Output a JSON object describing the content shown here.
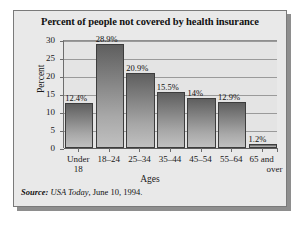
{
  "figure": {
    "title": "Percent of people not covered by health insurance",
    "source": {
      "lead": "Source:",
      "publication": " USA Today",
      "rest": ", June 10, 1994."
    }
  },
  "chart_data": {
    "type": "bar",
    "title": "Percent of people not covered by health insurance",
    "xlabel": "Ages",
    "ylabel": "Percent",
    "categories": [
      "Under 18",
      "18–24",
      "25–34",
      "35–44",
      "45–54",
      "55–64",
      "65 and over"
    ],
    "category_lines": [
      {
        "line1": "Under",
        "line2": "18"
      },
      {
        "line1": "18–24",
        "line2": ""
      },
      {
        "line1": "25–34",
        "line2": ""
      },
      {
        "line1": "35–44",
        "line2": ""
      },
      {
        "line1": "45–54",
        "line2": ""
      },
      {
        "line1": "55–64",
        "line2": ""
      },
      {
        "line1": "65 and",
        "line2": "over"
      }
    ],
    "values": [
      12.4,
      28.9,
      20.9,
      15.5,
      14,
      12.9,
      1.2
    ],
    "data_labels": [
      "12.4%",
      "28.9%",
      "20.9%",
      "15.5%",
      "14%",
      "12.9%",
      "1.2%"
    ],
    "ylim": [
      0,
      30
    ],
    "yticks": [
      0,
      5,
      10,
      15,
      20,
      25,
      30
    ],
    "ytick_labels": [
      "0",
      "5",
      "10",
      "15",
      "20",
      "25",
      "30"
    ],
    "grid": true,
    "legend": false,
    "bar_color": "#838383",
    "plot_bg": "#e4e4e4",
    "frame_bg": "#e9e9e9"
  }
}
